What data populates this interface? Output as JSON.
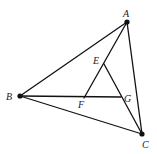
{
  "diagram": {
    "type": "geometry",
    "stroke_color": "#111111",
    "points": {
      "A": {
        "label": "A",
        "x": 127,
        "y": 22,
        "dot": true,
        "lx": 123,
        "ly": 17
      },
      "B": {
        "label": "B",
        "x": 20,
        "y": 96,
        "dot": true,
        "lx": 6,
        "ly": 100
      },
      "C": {
        "label": "C",
        "x": 142,
        "y": 134,
        "dot": true,
        "lx": 142,
        "ly": 148
      },
      "E": {
        "label": "E",
        "x": 104,
        "y": 64,
        "dot": false,
        "lx": 93,
        "ly": 64
      },
      "F": {
        "label": "F",
        "x": 84,
        "y": 98,
        "dot": false,
        "lx": 78,
        "ly": 108
      },
      "G": {
        "label": "G",
        "x": 121,
        "y": 97,
        "dot": false,
        "lx": 124,
        "ly": 102
      }
    },
    "segments": [
      [
        "A",
        "B"
      ],
      [
        "B",
        "C"
      ],
      [
        "A",
        "C"
      ],
      [
        "A",
        "F"
      ],
      [
        "B",
        "G"
      ],
      [
        "E",
        "C"
      ]
    ]
  }
}
